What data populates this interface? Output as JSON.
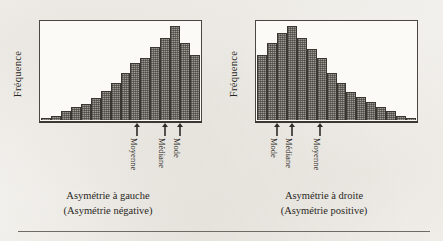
{
  "figure": {
    "background_color": "#f2f0ec",
    "ink_color": "#2b2824",
    "bar_fill_color": "#9d9a94",
    "bar_outline_color": "#3a3733"
  },
  "panels": [
    {
      "id": "left",
      "ylabel": "Fréquence",
      "caption_line1": "Asymétrie à gauche",
      "caption_line2": "(Asymétrie négative)",
      "markers": [
        {
          "label": "Moyenne",
          "x_percent": 60.0
        },
        {
          "label": "Médiane",
          "x_percent": 77.5
        },
        {
          "label": "Mode",
          "x_percent": 86.5
        }
      ]
    },
    {
      "id": "right",
      "ylabel": "Fréquence",
      "caption_line1": "Asymétrie à droite",
      "caption_line2": "(Asymétrie positive)",
      "markers": [
        {
          "label": "Mode",
          "x_percent": 13.5
        },
        {
          "label": "Médiane",
          "x_percent": 22.5
        },
        {
          "label": "Moyenne",
          "x_percent": 40.0
        }
      ]
    }
  ],
  "chart_data": [
    {
      "type": "bar",
      "id": "left-histogram",
      "title": "Asymétrie à gauche (Asymétrie négative)",
      "xlabel": "",
      "ylabel": "Fréquence",
      "grid": false,
      "legend": "none",
      "ylim": [
        0,
        100
      ],
      "categories": [
        "1",
        "2",
        "3",
        "4",
        "5",
        "6",
        "7",
        "8",
        "9",
        "10",
        "11",
        "12",
        "13",
        "14",
        "15",
        "16"
      ],
      "values": [
        2,
        4,
        9,
        13,
        16,
        22,
        30,
        38,
        48,
        58,
        63,
        74,
        84,
        96,
        79,
        66
      ],
      "annotations": [
        {
          "text": "Moyenne",
          "at_category": "10"
        },
        {
          "text": "Médiane",
          "at_category": "13"
        },
        {
          "text": "Mode",
          "at_category": "14"
        }
      ]
    },
    {
      "type": "bar",
      "id": "right-histogram",
      "title": "Asymétrie à droite (Asymétrie positive)",
      "xlabel": "",
      "ylabel": "Fréquence",
      "grid": false,
      "legend": "none",
      "ylim": [
        0,
        100
      ],
      "categories": [
        "1",
        "2",
        "3",
        "4",
        "5",
        "6",
        "7",
        "8",
        "9",
        "10",
        "11",
        "12",
        "13",
        "14",
        "15",
        "16"
      ],
      "values": [
        66,
        79,
        89,
        96,
        84,
        72,
        63,
        48,
        38,
        29,
        23,
        18,
        13,
        9,
        4,
        2
      ],
      "annotations": [
        {
          "text": "Mode",
          "at_category": "3"
        },
        {
          "text": "Médiane",
          "at_category": "4"
        },
        {
          "text": "Moyenne",
          "at_category": "7"
        }
      ]
    }
  ]
}
